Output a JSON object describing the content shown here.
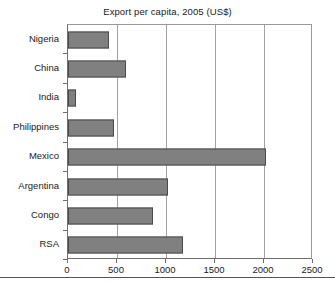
{
  "chart_data": {
    "type": "bar",
    "orientation": "horizontal",
    "title": "Export per capita, 2005 (US$)",
    "xlabel": "",
    "ylabel": "",
    "categories": [
      "Nigeria",
      "China",
      "India",
      "Philippines",
      "Mexico",
      "Argentina",
      "Congo",
      "RSA"
    ],
    "values": [
      420,
      590,
      80,
      470,
      2025,
      1020,
      870,
      1170
    ],
    "series": [
      {
        "name": "Export per capita",
        "values": [
          420,
          590,
          80,
          470,
          2025,
          1020,
          870,
          1170
        ]
      }
    ],
    "xlim": [
      0,
      2500
    ],
    "xticks": [
      0,
      500,
      1000,
      1500,
      2000,
      2500
    ],
    "xtick_labels": [
      "0",
      "500",
      "1000",
      "1500",
      "2000",
      "2500"
    ],
    "grid": "vertical",
    "legend": null,
    "bar_color": "#808080",
    "bar_edge_color": "#4a4a4a",
    "background_color": "#ffffff",
    "axis_color": "#6e6e6e",
    "gridline_color": "#a2a2a2",
    "text_color": "#1a1a1a"
  }
}
